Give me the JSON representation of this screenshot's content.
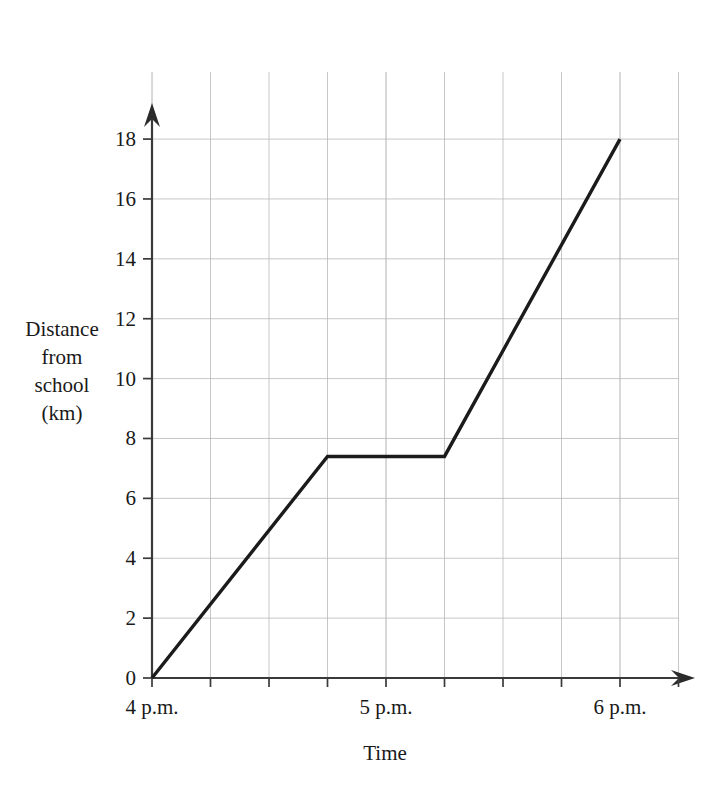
{
  "chart_data": {
    "type": "line",
    "title": "",
    "xlabel": "Time",
    "ylabel": "Distance from school (km)",
    "ylabel_lines": [
      "Distance",
      "from",
      "school",
      "(km)"
    ],
    "x_tick_labels": [
      "4 p.m.",
      "5 p.m.",
      "6 p.m."
    ],
    "x_tick_values": [
      0,
      60,
      120
    ],
    "y_tick_labels": [
      "0",
      "2",
      "4",
      "6",
      "8",
      "10",
      "12",
      "14",
      "16",
      "18"
    ],
    "y_tick_values": [
      0,
      2,
      4,
      6,
      8,
      10,
      12,
      14,
      16,
      18
    ],
    "xlim": [
      0,
      135
    ],
    "ylim": [
      0,
      19.2
    ],
    "x_unit": "minutes after 4 p.m.",
    "y_unit": "km",
    "grid": true,
    "grid_x_step_minutes": 15,
    "grid_y_step_km": 2,
    "legend": "none",
    "series": [
      {
        "name": "Distance from school",
        "x": [
          0,
          45,
          75,
          120
        ],
        "y": [
          0,
          7.4,
          7.4,
          18
        ],
        "x_labels": [
          "4:00 p.m.",
          "4:45 p.m.",
          "5:15 p.m.",
          "6:00 p.m."
        ],
        "segments": [
          {
            "from_time": "4:00 p.m.",
            "to_time": "4:45 p.m.",
            "from_km": 0,
            "to_km": 7.4,
            "description": "travelling away from school"
          },
          {
            "from_time": "4:45 p.m.",
            "to_time": "5:15 p.m.",
            "from_km": 7.4,
            "to_km": 7.4,
            "description": "stopped"
          },
          {
            "from_time": "5:15 p.m.",
            "to_time": "6:00 p.m.",
            "from_km": 7.4,
            "to_km": 18,
            "description": "travelling away from school"
          }
        ]
      }
    ],
    "colors": {
      "line": "#1b1b1b",
      "axis": "#3a3a3a",
      "grid": "#b9b9bd",
      "background": "#ffffff",
      "text": "#191919"
    }
  },
  "geometry": {
    "origin_x": 152,
    "origin_y": 678,
    "px_per_minute": 3.9,
    "px_per_km": 29.94,
    "grid_top_y": 72,
    "grid_right_x": 679
  }
}
